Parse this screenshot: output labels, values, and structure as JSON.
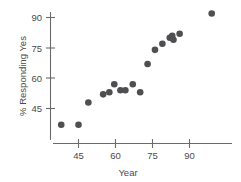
{
  "chart_data": {
    "type": "scatter",
    "title": "",
    "subtitle": "",
    "xlabel": "Year",
    "ylabel": "% Responding Yes",
    "xlim": [
      36,
      101
    ],
    "ylim": [
      32,
      96
    ],
    "xticks": [
      45,
      60,
      75,
      90
    ],
    "yticks": [
      45,
      60,
      75,
      90
    ],
    "xtick_labels": [
      "45",
      "60",
      "75",
      "90"
    ],
    "ytick_labels": [
      "45",
      "60",
      "75",
      "90"
    ],
    "grid": false,
    "legend": null,
    "legend_position": "none",
    "annotations": [],
    "marker": {
      "shape": "circle",
      "color": "#4f4f52",
      "size": 3.3
    },
    "series": [
      {
        "name": "Responding Yes",
        "points": [
          {
            "x": 38,
            "y": 37
          },
          {
            "x": 45,
            "y": 37
          },
          {
            "x": 49,
            "y": 48
          },
          {
            "x": 55,
            "y": 52
          },
          {
            "x": 57.5,
            "y": 53
          },
          {
            "x": 59.5,
            "y": 57
          },
          {
            "x": 62,
            "y": 54
          },
          {
            "x": 64,
            "y": 54
          },
          {
            "x": 67,
            "y": 57
          },
          {
            "x": 70,
            "y": 53
          },
          {
            "x": 73,
            "y": 67
          },
          {
            "x": 76,
            "y": 74
          },
          {
            "x": 79,
            "y": 77
          },
          {
            "x": 82,
            "y": 80
          },
          {
            "x": 83,
            "y": 81
          },
          {
            "x": 83.5,
            "y": 79
          },
          {
            "x": 86,
            "y": 82
          },
          {
            "x": 99,
            "y": 92
          }
        ]
      }
    ]
  },
  "axes": {
    "y_axis_name": "y-axis",
    "x_axis_name": "x-axis"
  }
}
